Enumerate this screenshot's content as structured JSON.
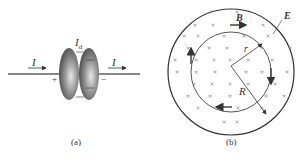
{
  "panel_a": {
    "caption": "(a)",
    "current_left_label": "I",
    "current_right_label": "I",
    "displacement_current_label": "I",
    "displacement_current_subscript": "d",
    "plus_sign": "+",
    "minus_sign": "−"
  },
  "panel_b": {
    "caption": "(b)",
    "magnetic_field_label": "B",
    "electric_field_label": "E",
    "inner_radius_label": "r",
    "outer_radius_label": "R"
  },
  "colors": {
    "line": "#333333",
    "plate_dark": "#555555",
    "plate_light": "#cccccc",
    "cross": "#777777"
  }
}
